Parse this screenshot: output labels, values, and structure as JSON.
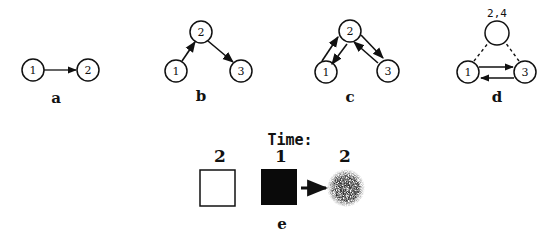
{
  "colors": {
    "ink": "#111111",
    "background": "#ffffff",
    "blob": "#3a3a3a"
  },
  "panels": {
    "a": {
      "label": "a",
      "nodes": [
        {
          "id": "1",
          "label": "1"
        },
        {
          "id": "2",
          "label": "2"
        }
      ],
      "edges": [
        {
          "from": "1",
          "to": "2",
          "style": "solid-arrow"
        }
      ]
    },
    "b": {
      "label": "b",
      "nodes": [
        {
          "id": "1",
          "label": "1"
        },
        {
          "id": "2",
          "label": "2"
        },
        {
          "id": "3",
          "label": "3"
        }
      ],
      "edges": [
        {
          "from": "1",
          "to": "2",
          "style": "solid-arrow"
        },
        {
          "from": "2",
          "to": "3",
          "style": "solid-arrow"
        }
      ]
    },
    "c": {
      "label": "c",
      "nodes": [
        {
          "id": "1",
          "label": "1"
        },
        {
          "id": "2",
          "label": "2"
        },
        {
          "id": "3",
          "label": "3"
        }
      ],
      "edges": [
        {
          "from": "1",
          "to": "2",
          "style": "solid-arrow"
        },
        {
          "from": "2",
          "to": "1",
          "style": "solid-arrow"
        },
        {
          "from": "2",
          "to": "3",
          "style": "solid-arrow"
        },
        {
          "from": "3",
          "to": "2",
          "style": "solid-arrow"
        }
      ]
    },
    "d": {
      "label": "d",
      "top_node_caption": "2,4",
      "nodes": [
        {
          "id": "2,4",
          "label": ""
        },
        {
          "id": "1",
          "label": "1"
        },
        {
          "id": "3",
          "label": "3"
        }
      ],
      "edges": [
        {
          "from": "1",
          "to": "2,4",
          "style": "dashed"
        },
        {
          "from": "3",
          "to": "2,4",
          "style": "dashed"
        },
        {
          "from": "1",
          "to": "3",
          "style": "solid-arrow"
        },
        {
          "from": "3",
          "to": "1",
          "style": "solid-arrow"
        }
      ]
    },
    "e": {
      "label": "e",
      "title": "Time:",
      "items": [
        {
          "time": "2",
          "shape": "white-square"
        },
        {
          "time": "1",
          "shape": "black-square"
        },
        {
          "time": "2",
          "shape": "speckled-blob"
        }
      ]
    }
  }
}
